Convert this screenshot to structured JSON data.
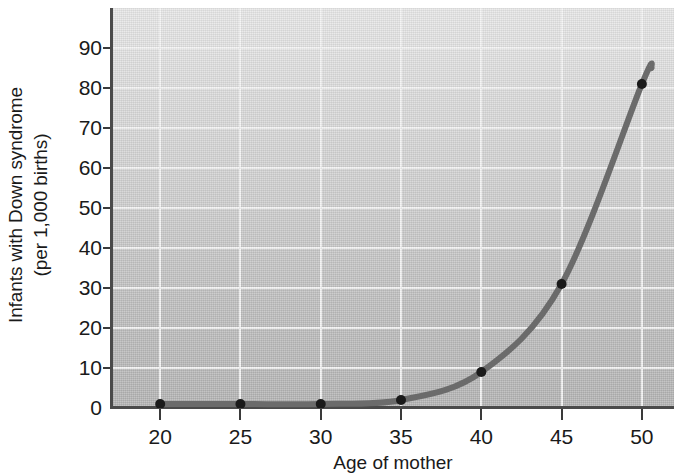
{
  "chart_data": {
    "type": "line",
    "title": "",
    "xlabel": "Age of mother",
    "ylabel": "Infants with Down syndrome (per 1,000 births)",
    "ylabel_line1": "Infants with Down syndrome",
    "ylabel_line2": "(per 1,000 births)",
    "x": [
      20,
      25,
      30,
      35,
      40,
      45,
      50
    ],
    "values": [
      1,
      1,
      1,
      2,
      9,
      31,
      81
    ],
    "series": [
      {
        "name": "Infants with Down syndrome per 1,000 births",
        "x": [
          20,
          25,
          30,
          35,
          40,
          45,
          50
        ],
        "values": [
          1,
          1,
          1,
          2,
          9,
          31,
          81
        ]
      }
    ],
    "xlim": [
      17,
      52
    ],
    "ylim": [
      0,
      100
    ],
    "xticks": [
      20,
      25,
      30,
      35,
      40,
      45,
      50
    ],
    "yticks": [
      0,
      10,
      20,
      30,
      40,
      50,
      60,
      70,
      80,
      90
    ],
    "xtick_labels": [
      "20",
      "25",
      "30",
      "35",
      "40",
      "45",
      "50"
    ],
    "ytick_labels": [
      "0",
      "10",
      "20",
      "30",
      "40",
      "50",
      "60",
      "70",
      "80",
      "90"
    ],
    "grid": true,
    "grid_color": "#f4f4f4",
    "legend": "none",
    "line_color": "#6b6b6b",
    "marker_color": "#1a1a1a",
    "plot_background_top": "#e8e8e8",
    "plot_background_bottom": "#b4b4b4",
    "axis_color": "#4a4a4a",
    "text_color": "#1a1a1a",
    "curve_extends_past_last_point_to": 85
  }
}
